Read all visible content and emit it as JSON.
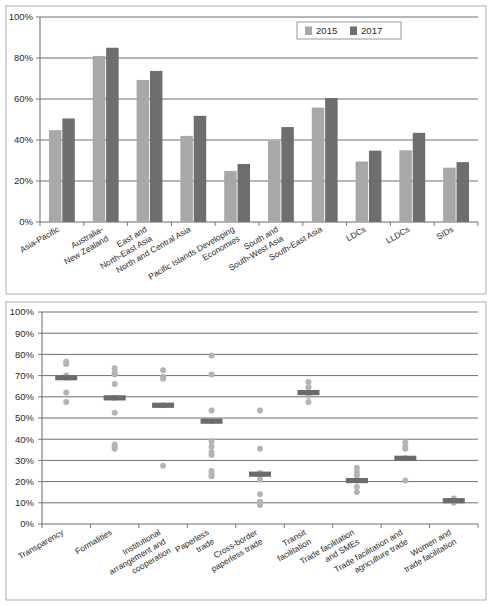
{
  "chart_data": [
    {
      "id": "top-bar-chart",
      "type": "bar",
      "title": "",
      "xlabel": "",
      "ylabel": "",
      "ylim": [
        0,
        100
      ],
      "yticks": [
        "0%",
        "20%",
        "40%",
        "60%",
        "80%",
        "100%"
      ],
      "ytick_values": [
        0,
        20,
        40,
        60,
        80,
        100
      ],
      "grid": true,
      "legend_position": "top-right",
      "legend": [
        "2015",
        "2017"
      ],
      "categories": [
        "Asia-Pacific",
        "Australia-\nNew Zealand",
        "East and\nNorth-East Asia",
        "North and Central Asia",
        "Pacific Islands Developing\nEconomies",
        "South and\nSouth-West Asia",
        "South-East Asia",
        "LDCs",
        "LLDCs",
        "SIDs"
      ],
      "category_lines": [
        [
          "Asia-Pacific"
        ],
        [
          "Australia-",
          "New Zealand"
        ],
        [
          "East and",
          "North-East Asia"
        ],
        [
          "North and Central Asia"
        ],
        [
          "Pacific Islands Developing",
          "Economies"
        ],
        [
          "South and",
          "South-West Asia"
        ],
        [
          "South-East Asia"
        ],
        [
          "LDCs"
        ],
        [
          "LLDCs"
        ],
        [
          "SIDs"
        ]
      ],
      "series": [
        {
          "name": "2015",
          "color": "#a8a8a8",
          "values": [
            44.8,
            81.0,
            69.3,
            42.0,
            24.9,
            39.6,
            55.8,
            29.5,
            35.0,
            26.5
          ]
        },
        {
          "name": "2017",
          "color": "#6e6e6e",
          "values": [
            50.5,
            85.0,
            73.7,
            51.8,
            28.3,
            46.3,
            60.5,
            34.8,
            43.5,
            29.2
          ]
        }
      ]
    },
    {
      "id": "bottom-dot-chart",
      "type": "scatter",
      "title": "",
      "xlabel": "",
      "ylabel": "",
      "ylim": [
        0,
        100
      ],
      "yticks": [
        "0%",
        "10%",
        "20%",
        "30%",
        "40%",
        "50%",
        "60%",
        "70%",
        "80%",
        "90%",
        "100%"
      ],
      "ytick_values": [
        0,
        10,
        20,
        30,
        40,
        50,
        60,
        70,
        80,
        90,
        100
      ],
      "grid": true,
      "legend_position": "none",
      "legend": [],
      "categories": [
        "Transparency",
        "Formalities",
        "Institutional\narrangement and\ncooperation",
        "Paperless\ntrade",
        "Cross-border\npaperless trade",
        "Transit\nfacilitation",
        "Trade facilitation\nand SMEs",
        "Trade facilitation and\nagriculture trade",
        "Women and\ntrade facilitation"
      ],
      "category_lines": [
        [
          "Transparency"
        ],
        [
          "Formalities"
        ],
        [
          "Institutional",
          "arrangement and",
          "cooperation"
        ],
        [
          "Paperless",
          "trade"
        ],
        [
          "Cross-border",
          "paperless trade"
        ],
        [
          "Transit",
          "facilitation"
        ],
        [
          "Trade facilitation",
          "and SMEs"
        ],
        [
          "Trade facilitation and",
          "agriculture trade"
        ],
        [
          "Women and",
          "trade facilitation"
        ]
      ],
      "groups": [
        {
          "category": "Transparency",
          "median": 69.0,
          "points": [
            76.5,
            75.5,
            70.0,
            69.0,
            62.0,
            57.5
          ]
        },
        {
          "category": "Formalities",
          "median": 59.5,
          "points": [
            73.5,
            71.5,
            70.5,
            66.0,
            59.5,
            52.5,
            37.5,
            36.5,
            35.5
          ]
        },
        {
          "category": "Institutional arrangement and cooperation",
          "median": 56.0,
          "points": [
            72.5,
            69.5,
            68.5,
            56.0,
            27.5
          ]
        },
        {
          "category": "Paperless trade",
          "median": 48.5,
          "points": [
            79.5,
            70.5,
            53.5,
            48.5,
            39.0,
            36.5,
            34.0,
            32.5,
            25.0,
            23.5,
            22.5
          ]
        },
        {
          "category": "Cross-border paperless trade",
          "median": 23.5,
          "points": [
            53.5,
            35.5,
            24.0,
            23.0,
            21.0,
            14.0,
            10.5,
            9.0
          ]
        },
        {
          "category": "Transit facilitation",
          "median": 62.0,
          "points": [
            67.0,
            64.5,
            62.0,
            60.5,
            57.5
          ]
        },
        {
          "category": "Trade facilitation and SMEs",
          "median": 20.5,
          "points": [
            26.5,
            24.5,
            23.0,
            20.5,
            17.5,
            15.0
          ]
        },
        {
          "category": "Trade facilitation and agriculture trade",
          "median": 31.0,
          "points": [
            38.5,
            36.5,
            35.5,
            31.0,
            20.5
          ]
        },
        {
          "category": "Women and trade facilitation",
          "median": 11.0,
          "points": [
            12.0,
            11.0,
            10.0
          ]
        }
      ],
      "point_color": "#b4b4b4",
      "median_color": "#6b6b6b"
    }
  ]
}
